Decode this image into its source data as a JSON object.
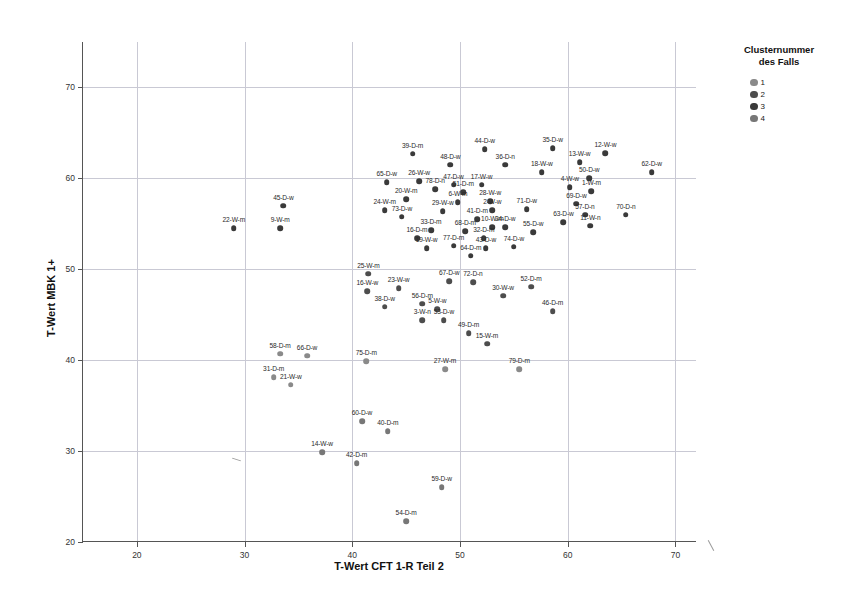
{
  "chart_data": {
    "type": "scatter",
    "title": "",
    "xlabel": "T-Wert CFT 1-R Teil 2",
    "ylabel": "T-Wert MBK 1+",
    "xlim": [
      15,
      72
    ],
    "ylim": [
      20,
      75
    ],
    "xticks": [
      20,
      30,
      40,
      50,
      60,
      70
    ],
    "yticks": [
      20,
      30,
      40,
      50,
      60,
      70
    ],
    "grid": true,
    "legend": {
      "title_line1": "Clusternummer",
      "title_line2": "des Falls",
      "position": "top-right",
      "entries": [
        {
          "label": "1",
          "color": "#8a8a8a"
        },
        {
          "label": "2",
          "color": "#4d4d4d"
        },
        {
          "label": "3",
          "color": "#3a3a3a"
        },
        {
          "label": "4",
          "color": "#777777"
        }
      ]
    },
    "point_label_format": "case-group-sex",
    "points": [
      {
        "label": "22-W-m",
        "x": 29.0,
        "y": 54.5,
        "cluster": 3
      },
      {
        "label": "9-W-m",
        "x": 33.3,
        "y": 54.5,
        "cluster": 3
      },
      {
        "label": "45-D-w",
        "x": 33.6,
        "y": 57.0,
        "cluster": 3
      },
      {
        "label": "39-D-m",
        "x": 45.6,
        "y": 62.7,
        "cluster": 3
      },
      {
        "label": "44-D-w",
        "x": 52.3,
        "y": 63.2,
        "cluster": 3
      },
      {
        "label": "35-D-w",
        "x": 58.6,
        "y": 63.3,
        "cluster": 3
      },
      {
        "label": "12-W-w",
        "x": 63.5,
        "y": 62.8,
        "cluster": 3
      },
      {
        "label": "48-D-w",
        "x": 49.1,
        "y": 61.5,
        "cluster": 3
      },
      {
        "label": "36-D-n",
        "x": 54.2,
        "y": 61.5,
        "cluster": 3
      },
      {
        "label": "13-W-w",
        "x": 61.1,
        "y": 61.8,
        "cluster": 3
      },
      {
        "label": "18-W-w",
        "x": 57.6,
        "y": 60.7,
        "cluster": 3
      },
      {
        "label": "62-D-w",
        "x": 67.8,
        "y": 60.7,
        "cluster": 3
      },
      {
        "label": "50-D-w",
        "x": 62.0,
        "y": 60.0,
        "cluster": 3
      },
      {
        "label": "65-D-w",
        "x": 43.2,
        "y": 59.6,
        "cluster": 3
      },
      {
        "label": "26-W-w",
        "x": 46.2,
        "y": 59.7,
        "cluster": 3
      },
      {
        "label": "47-D-w",
        "x": 49.4,
        "y": 59.3,
        "cluster": 3
      },
      {
        "label": "17-W-w",
        "x": 52.0,
        "y": 59.3,
        "cluster": 3
      },
      {
        "label": "4-W-w",
        "x": 60.2,
        "y": 59.0,
        "cluster": 3
      },
      {
        "label": "78-D-n",
        "x": 47.7,
        "y": 58.8,
        "cluster": 3
      },
      {
        "label": "1-W-m",
        "x": 62.2,
        "y": 58.6,
        "cluster": 3
      },
      {
        "label": "51-D-m",
        "x": 50.3,
        "y": 58.5,
        "cluster": 3
      },
      {
        "label": "20-W-m",
        "x": 45.0,
        "y": 57.7,
        "cluster": 3
      },
      {
        "label": "28-W-w",
        "x": 52.8,
        "y": 57.5,
        "cluster": 3
      },
      {
        "label": "6-W-m",
        "x": 49.8,
        "y": 57.4,
        "cluster": 3
      },
      {
        "label": "69-D-w",
        "x": 60.8,
        "y": 57.2,
        "cluster": 3
      },
      {
        "label": "24-W-m",
        "x": 43.0,
        "y": 56.5,
        "cluster": 3
      },
      {
        "label": "73-D-w",
        "x": 44.6,
        "y": 55.8,
        "cluster": 3
      },
      {
        "label": "29-W-w",
        "x": 48.4,
        "y": 56.4,
        "cluster": 3
      },
      {
        "label": "2-W-w",
        "x": 53.0,
        "y": 56.5,
        "cluster": 3
      },
      {
        "label": "71-D-w",
        "x": 56.2,
        "y": 56.6,
        "cluster": 3
      },
      {
        "label": "57-D-n",
        "x": 61.6,
        "y": 56.0,
        "cluster": 3
      },
      {
        "label": "70-D-n",
        "x": 65.4,
        "y": 56.0,
        "cluster": 3
      },
      {
        "label": "63-D-w",
        "x": 59.6,
        "y": 55.2,
        "cluster": 3
      },
      {
        "label": "41-D-m",
        "x": 51.6,
        "y": 55.5,
        "cluster": 3
      },
      {
        "label": "11-W-n",
        "x": 62.1,
        "y": 54.8,
        "cluster": 3
      },
      {
        "label": "33-D-m",
        "x": 47.3,
        "y": 54.3,
        "cluster": 3
      },
      {
        "label": "68-D-m",
        "x": 50.5,
        "y": 54.2,
        "cluster": 3
      },
      {
        "label": "10-W-m",
        "x": 53.0,
        "y": 54.6,
        "cluster": 3
      },
      {
        "label": "34-D-w",
        "x": 54.2,
        "y": 54.6,
        "cluster": 3
      },
      {
        "label": "55-D-w",
        "x": 56.8,
        "y": 54.1,
        "cluster": 3
      },
      {
        "label": "16-D-m",
        "x": 46.0,
        "y": 53.4,
        "cluster": 3
      },
      {
        "label": "32-D-m",
        "x": 52.2,
        "y": 53.4,
        "cluster": 3
      },
      {
        "label": "19-W-w",
        "x": 46.9,
        "y": 52.3,
        "cluster": 3
      },
      {
        "label": "77-D-m",
        "x": 49.4,
        "y": 52.6,
        "cluster": 3
      },
      {
        "label": "43-D-w",
        "x": 52.4,
        "y": 52.3,
        "cluster": 3
      },
      {
        "label": "74-D-w",
        "x": 55.0,
        "y": 52.5,
        "cluster": 3
      },
      {
        "label": "64-D-m",
        "x": 51.0,
        "y": 51.5,
        "cluster": 3
      },
      {
        "label": "25-W-m",
        "x": 41.5,
        "y": 49.5,
        "cluster": 2
      },
      {
        "label": "67-D-w",
        "x": 49.0,
        "y": 48.7,
        "cluster": 2
      },
      {
        "label": "72-D-n",
        "x": 51.2,
        "y": 48.6,
        "cluster": 2
      },
      {
        "label": "52-D-m",
        "x": 56.6,
        "y": 48.1,
        "cluster": 2
      },
      {
        "label": "16-W-w",
        "x": 41.4,
        "y": 47.6,
        "cluster": 2
      },
      {
        "label": "23-W-w",
        "x": 44.3,
        "y": 47.9,
        "cluster": 2
      },
      {
        "label": "30-W-w",
        "x": 54.0,
        "y": 47.1,
        "cluster": 2
      },
      {
        "label": "38-D-w",
        "x": 43.0,
        "y": 45.9,
        "cluster": 2
      },
      {
        "label": "56-D-m",
        "x": 46.5,
        "y": 46.2,
        "cluster": 2
      },
      {
        "label": "5-W-w",
        "x": 47.9,
        "y": 45.6,
        "cluster": 2
      },
      {
        "label": "46-D-m",
        "x": 58.6,
        "y": 45.4,
        "cluster": 2
      },
      {
        "label": "3-W-n",
        "x": 46.5,
        "y": 44.4,
        "cluster": 2
      },
      {
        "label": "53-D-w",
        "x": 48.5,
        "y": 44.4,
        "cluster": 2
      },
      {
        "label": "49-D-m",
        "x": 50.8,
        "y": 43.0,
        "cluster": 2
      },
      {
        "label": "15-W-m",
        "x": 52.5,
        "y": 41.8,
        "cluster": 2
      },
      {
        "label": "58-D-m",
        "x": 33.3,
        "y": 40.7,
        "cluster": 1
      },
      {
        "label": "66-D-w",
        "x": 35.8,
        "y": 40.5,
        "cluster": 1
      },
      {
        "label": "75-D-m",
        "x": 41.3,
        "y": 39.9,
        "cluster": 1
      },
      {
        "label": "27-W-m",
        "x": 48.6,
        "y": 39.0,
        "cluster": 1
      },
      {
        "label": "79-D-m",
        "x": 55.5,
        "y": 39.0,
        "cluster": 1
      },
      {
        "label": "31-D-m",
        "x": 32.7,
        "y": 38.1,
        "cluster": 1
      },
      {
        "label": "21-W-w",
        "x": 34.3,
        "y": 37.3,
        "cluster": 1
      },
      {
        "label": "60-D-w",
        "x": 40.9,
        "y": 33.3,
        "cluster": 4
      },
      {
        "label": "40-D-m",
        "x": 43.3,
        "y": 32.2,
        "cluster": 4
      },
      {
        "label": "14-W-w",
        "x": 37.2,
        "y": 29.9,
        "cluster": 4
      },
      {
        "label": "42-D-m",
        "x": 40.4,
        "y": 28.7,
        "cluster": 4
      },
      {
        "label": "59-D-w",
        "x": 48.3,
        "y": 26.0,
        "cluster": 4
      },
      {
        "label": "54-D-m",
        "x": 45.0,
        "y": 22.3,
        "cluster": 4
      }
    ]
  }
}
